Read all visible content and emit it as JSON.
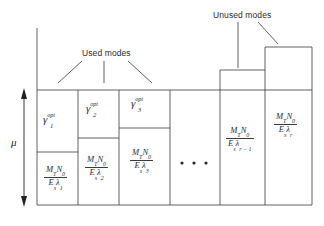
{
  "figure": {
    "type": "water-filling-diagram",
    "annotations": {
      "used_modes": "Used modes",
      "unused_modes": "Unused modes",
      "level_label": "μ",
      "ellipsis": "• • •"
    },
    "colors": {
      "line": "#3a3a3a",
      "text": "#2a2a2a",
      "math": "#22303f",
      "background": "#ffffff"
    },
    "columns": [
      {
        "index": 1,
        "status": "used",
        "gamma": {
          "symbol": "γ",
          "superscript": "opt",
          "subscript": "1"
        },
        "noise": {
          "numerator": "M",
          "numerator_sub": "T",
          "numerator2": "N",
          "numerator2_sub": "0",
          "denominator": "E",
          "denominator_sub": "s",
          "lambda": "λ",
          "lambda_sub": "1"
        }
      },
      {
        "index": 2,
        "status": "used",
        "gamma": {
          "symbol": "γ",
          "superscript": "opt",
          "subscript": "2"
        },
        "noise": {
          "numerator": "M",
          "numerator_sub": "T",
          "numerator2": "N",
          "numerator2_sub": "0",
          "denominator": "E",
          "denominator_sub": "s",
          "lambda": "λ",
          "lambda_sub": "2"
        }
      },
      {
        "index": 3,
        "status": "used",
        "gamma": {
          "symbol": "γ",
          "superscript": "opt",
          "subscript": "3"
        },
        "noise": {
          "numerator": "M",
          "numerator_sub": "T",
          "numerator2": "N",
          "numerator2_sub": "0",
          "denominator": "E",
          "denominator_sub": "s",
          "lambda": "λ",
          "lambda_sub": "3"
        }
      },
      {
        "index": 4,
        "status": "unused",
        "gamma": null,
        "noise": {
          "numerator": "M",
          "numerator_sub": "T",
          "numerator2": "N",
          "numerator2_sub": "0",
          "denominator": "E",
          "denominator_sub": "s",
          "lambda": "λ",
          "lambda_sub": "r − 1"
        }
      },
      {
        "index": 5,
        "status": "unused",
        "gamma": null,
        "noise": {
          "numerator": "M",
          "numerator_sub": "T",
          "numerator2": "N",
          "numerator2_sub": "0",
          "denominator": "E",
          "denominator_sub": "s",
          "lambda": "λ",
          "lambda_sub": "r"
        }
      }
    ]
  }
}
